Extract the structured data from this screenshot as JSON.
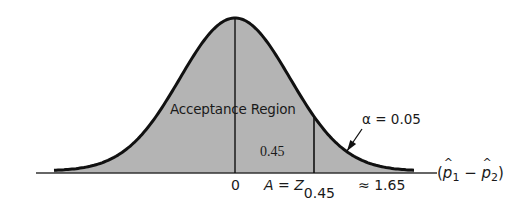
{
  "figure": {
    "title": "",
    "colors": {
      "fill": "#b4b4b4",
      "curve": "#111111",
      "axis": "#333333",
      "background": "#ffffff"
    },
    "labels": {
      "acceptance_region": "Acceptance Region",
      "area_value": "0.45",
      "alpha": "α = 0.05",
      "zero": "0",
      "critical_prefix": "A = ",
      "critical_Z": "Z",
      "critical_sub": "0.45",
      "critical_approx": "≈ 1.65",
      "x_axis_open": "(",
      "x_axis_p": "p",
      "x_axis_sub1": "1",
      "x_axis_minus": " − ",
      "x_axis_sub2": "2",
      "x_axis_close": ")"
    }
  },
  "chart_data": {
    "type": "area",
    "distribution": "normal",
    "title": "",
    "xlabel": "(p̂1 − p̂2)",
    "ylabel": "",
    "mean": 0,
    "critical_value": 1.65,
    "critical_label": "A = Z0.45 ≈ 1.65",
    "regions": [
      {
        "name": "Acceptance Region",
        "from": "-inf",
        "to": 1.65,
        "area_right_of_mean": 0.45
      },
      {
        "name": "Rejection Region",
        "from": 1.65,
        "to": "inf",
        "area": 0.05,
        "label": "α = 0.05"
      }
    ],
    "marked_x": [
      0,
      1.65
    ],
    "annotations": [
      "Acceptance Region",
      "0.45",
      "α = 0.05"
    ],
    "render": {
      "center_px": 235,
      "baseline_px": 171,
      "peak_px": 18,
      "sigma_px": 55,
      "curve_from_px": 54,
      "curve_to_px": 414,
      "axis_from_px": 36,
      "axis_to_px": 437,
      "axis_y_px": 173,
      "critical_px": 314,
      "arrow": {
        "x1": 362,
        "y1": 129,
        "x2": 347,
        "y2": 151
      }
    }
  }
}
